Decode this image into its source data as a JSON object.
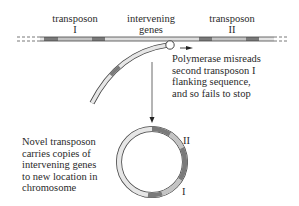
{
  "labels": {
    "transposon_1": {
      "line1": "transposon",
      "line2": "I"
    },
    "intervening": {
      "line1": "intervening",
      "line2": "genes"
    },
    "transposon_2": {
      "line1": "transposon",
      "line2": "II"
    }
  },
  "annotation_polymerase": {
    "lines": [
      "Polymerase misreads",
      "second transposon I",
      "flanking sequence,",
      "and so fails to stop"
    ]
  },
  "annotation_novel": {
    "lines": [
      "Novel transposon",
      "carries copies of",
      "intervening genes",
      "to new location in",
      "chromosome"
    ]
  },
  "ring_labels": {
    "top": "II",
    "bottom": "I"
  },
  "colors": {
    "dark_segment": "#7a7a7a",
    "light_segment": "#c8c8c8",
    "strand_fill": "#e6e6e6",
    "outline": "#444444"
  }
}
